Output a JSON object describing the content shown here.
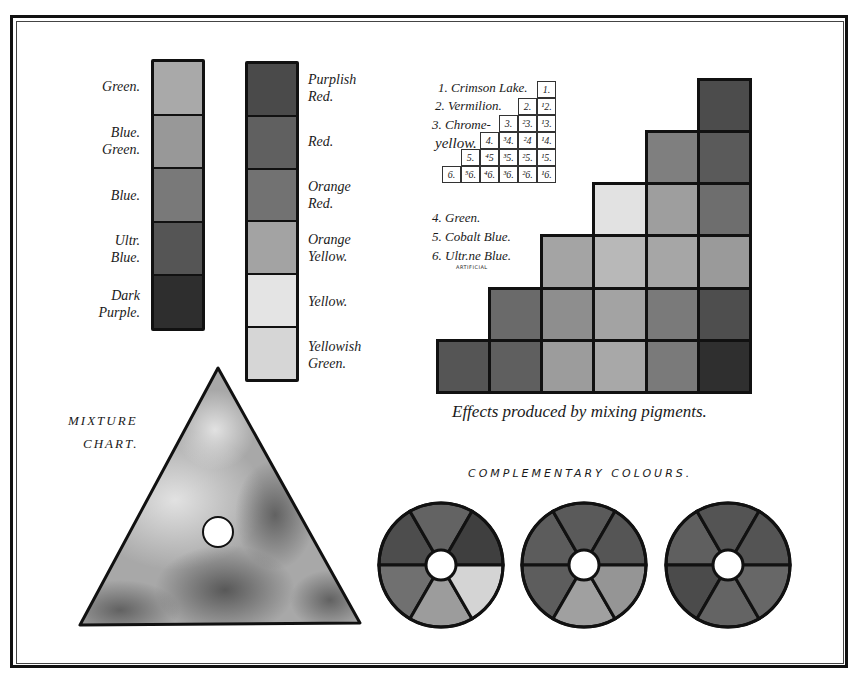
{
  "plate": {
    "frame_color": "#111111",
    "background": "#ffffff"
  },
  "strip_left": {
    "labels": [
      "Green.",
      "Blue Green.",
      "Blue.",
      "Ultr. Blue.",
      "Dark Purple."
    ],
    "label_lines": [
      [
        "Green."
      ],
      [
        "Blue.",
        "Green."
      ],
      [
        "Blue."
      ],
      [
        "Ultr.",
        "Blue."
      ],
      [
        "Dark",
        "Purple."
      ]
    ],
    "swatches": [
      "#a9a9a9",
      "#989898",
      "#797979",
      "#555555",
      "#2e2e2e"
    ]
  },
  "strip_right": {
    "labels": [
      "Purplish Red.",
      "Red.",
      "Orange Red.",
      "Orange Yellow.",
      "Yellow.",
      "Yellowish Green."
    ],
    "label_lines": [
      [
        "Purplish",
        "Red."
      ],
      [
        "Red."
      ],
      [
        "Orange",
        "Red."
      ],
      [
        "Orange",
        "Yellow."
      ],
      [
        "Yellow."
      ],
      [
        "Yellowish",
        "Green."
      ]
    ],
    "swatches": [
      "#4a4a4a",
      "#606060",
      "#727272",
      "#a3a3a3",
      "#e4e4e4",
      "#d6d6d6"
    ]
  },
  "pigment_key": {
    "pigments": [
      {
        "num": "1",
        "name": "1. Crimson Lake."
      },
      {
        "num": "2",
        "name": "2. Vermilion."
      },
      {
        "num": "3",
        "name": "3. Chrome-yellow."
      },
      {
        "num": "4",
        "name": "4. Green."
      },
      {
        "num": "5",
        "name": "5. Cobalt Blue."
      },
      {
        "num": "6",
        "name": "6. Ultr.ne Blue."
      }
    ],
    "label_1": "1. Crimson Lake.",
    "label_2": "2. Vermilion.",
    "label_3a": "3. Chrome-",
    "label_3b": "yellow.",
    "label_4": "4. Green.",
    "label_5": "5. Cobalt Blue.",
    "label_6": "6. Ultr.ne Blue.",
    "label_6_note": "ARTIFICIAL",
    "table_rows": [
      [
        "1."
      ],
      [
        "2.",
        "¹2."
      ],
      [
        "3.",
        "²3.",
        "¹3."
      ],
      [
        "4.",
        "³4.",
        "²4",
        "¹4."
      ],
      [
        "5.",
        "⁴5",
        "³5.",
        "²5.",
        "¹5."
      ],
      [
        "6.",
        "⁵6.",
        "⁴6.",
        "³6.",
        "²6.",
        "¹6."
      ]
    ]
  },
  "mixing_grid": {
    "caption": "Effects produced by mixing pigments.",
    "rows": [
      [
        "#4c4c4c"
      ],
      [
        "#7f7f7f",
        "#5a5a5a"
      ],
      [
        "#e2e2e2",
        "#9e9e9e",
        "#6e6e6e"
      ],
      [
        "#a4a4a4",
        "#b8b8b8",
        "#a6a6a6",
        "#9a9a9a"
      ],
      [
        "#6a6a6a",
        "#8e8e8e",
        "#a3a3a3",
        "#7a7a7a",
        "#4e4e4e"
      ],
      [
        "#555555",
        "#5f5f5f",
        "#9c9c9c",
        "#a8a8a8",
        "#7a7a7a",
        "#2f2f2f"
      ]
    ]
  },
  "mixture_chart": {
    "title_line1": "MIXTURE",
    "title_line2": "CHART."
  },
  "complementary": {
    "title": "COMPLEMENTARY COLOURS.",
    "wheels": [
      {
        "segments": [
          "#4d4d4d",
          "#636363",
          "#3f3f3f",
          "#707070",
          "#9c9c9c",
          "#d4d4d4"
        ]
      },
      {
        "segments": [
          "#5c5c5c",
          "#5a5a5a",
          "#555555",
          "#5d5d5d",
          "#a0a0a0",
          "#959595"
        ]
      },
      {
        "segments": [
          "#5f5f5f",
          "#545454",
          "#545454",
          "#4b4b4b",
          "#646464",
          "#676767"
        ]
      }
    ]
  }
}
